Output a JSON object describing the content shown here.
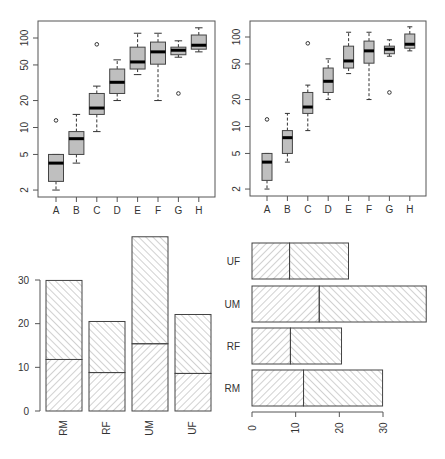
{
  "chart_data": [
    {
      "type": "boxplot",
      "panel": "top-left",
      "title": "",
      "xlabel": "",
      "ylabel": "",
      "yscale": "log",
      "yticks": [
        2,
        5,
        10,
        20,
        50,
        100
      ],
      "ytick_labels": [
        "2",
        "5",
        "10",
        "20",
        "50",
        "100"
      ],
      "categories": [
        "A",
        "B",
        "C",
        "D",
        "E",
        "F",
        "G",
        "H"
      ],
      "boxes": [
        {
          "label": "A",
          "whisker_low": 2.0,
          "q1": 2.5,
          "median": 4.0,
          "q3": 5.0,
          "whisker_high": 5.0,
          "outliers": [
            12
          ]
        },
        {
          "label": "B",
          "whisker_low": 4.0,
          "q1": 5.0,
          "median": 7.5,
          "q3": 9.0,
          "whisker_high": 14,
          "outliers": []
        },
        {
          "label": "C",
          "whisker_low": 9.0,
          "q1": 14,
          "median": 16.5,
          "q3": 24,
          "whisker_high": 29,
          "outliers": [
            85
          ]
        },
        {
          "label": "D",
          "whisker_low": 20,
          "q1": 24,
          "median": 32,
          "q3": 45,
          "whisker_high": 57,
          "outliers": []
        },
        {
          "label": "E",
          "whisker_low": 39,
          "q1": 45,
          "median": 54,
          "q3": 79,
          "whisker_high": 113,
          "outliers": []
        },
        {
          "label": "F",
          "whisker_low": 20,
          "q1": 51,
          "median": 70,
          "q3": 90,
          "whisker_high": 113,
          "outliers": []
        },
        {
          "label": "G",
          "whisker_low": 61,
          "q1": 65,
          "median": 73,
          "q3": 79,
          "whisker_high": 93,
          "outliers": [
            24
          ]
        },
        {
          "label": "H",
          "whisker_low": 70,
          "q1": 75,
          "median": 83,
          "q3": 108,
          "whisker_high": 130,
          "outliers": []
        }
      ],
      "box_fill": "#bfbfbf",
      "grid": false
    },
    {
      "type": "boxplot",
      "panel": "top-right",
      "note": "same data rendered with narrower boxes",
      "yscale": "log",
      "yticks": [
        2,
        5,
        10,
        20,
        50,
        100
      ],
      "ytick_labels": [
        "2",
        "5",
        "10",
        "20",
        "50",
        "100"
      ],
      "categories": [
        "A",
        "B",
        "C",
        "D",
        "E",
        "F",
        "G",
        "H"
      ],
      "box_fill": "#bfbfbf",
      "grid": false
    },
    {
      "type": "bar",
      "orientation": "vertical",
      "stacked": true,
      "panel": "bottom-left",
      "categories": [
        "RM",
        "RF",
        "UM",
        "UF"
      ],
      "series": [
        {
          "name": "lower",
          "values": [
            11.8,
            8.8,
            15.4,
            8.6
          ],
          "pattern": "hatch-45"
        },
        {
          "name": "upper",
          "values": [
            18.1,
            11.7,
            24.5,
            13.5
          ],
          "pattern": "hatch-135"
        }
      ],
      "totals": [
        29.9,
        20.5,
        39.9,
        22.1
      ],
      "yticks": [
        0,
        10,
        20,
        30
      ],
      "ylim": [
        0,
        40
      ],
      "grid": false
    },
    {
      "type": "bar",
      "orientation": "horizontal",
      "stacked": true,
      "panel": "bottom-right",
      "categories": [
        "RM",
        "RF",
        "UM",
        "UF"
      ],
      "series": [
        {
          "name": "lower",
          "values": [
            11.8,
            8.8,
            15.4,
            8.6
          ],
          "pattern": "hatch-45"
        },
        {
          "name": "upper",
          "values": [
            18.1,
            11.7,
            24.5,
            13.5
          ],
          "pattern": "hatch-135"
        }
      ],
      "totals": [
        29.9,
        20.5,
        39.9,
        22.1
      ],
      "xticks": [
        0,
        10,
        20,
        30
      ],
      "xlim": [
        0,
        40
      ],
      "grid": false
    }
  ],
  "labels": {
    "log_ticks": [
      "100",
      "50",
      "20",
      "10",
      "5",
      "2"
    ],
    "groups": [
      "A",
      "B",
      "C",
      "D",
      "E",
      "F",
      "G",
      "H"
    ],
    "bar_cats": [
      "RM",
      "RF",
      "UM",
      "UF"
    ],
    "bar_ticks": [
      "0",
      "10",
      "20",
      "30"
    ]
  }
}
